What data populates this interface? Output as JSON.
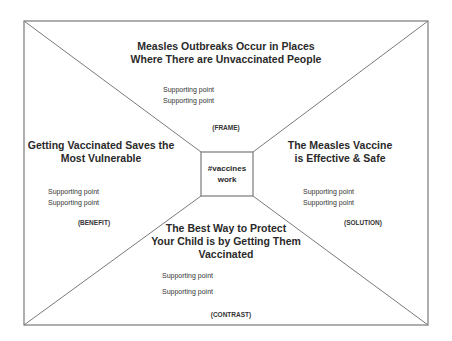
{
  "diagram": {
    "center": "#vaccines work",
    "sections": {
      "top": {
        "title_lines": [
          "Measles Outbreaks Occur in Places",
          "Where There are Unvaccinated People"
        ],
        "points": [
          "Supporting point",
          "Supporting point"
        ],
        "tag": "(FRAME)"
      },
      "left": {
        "title_lines": [
          "Getting Vaccinated Saves the",
          "Most Vulnerable"
        ],
        "points": [
          "Supporting point",
          "Supporting point"
        ],
        "tag": "(BENEFIT)"
      },
      "right": {
        "title_lines": [
          "The Measles Vaccine",
          "is Effective & Safe"
        ],
        "points": [
          "Supporting point",
          "Supporting point"
        ],
        "tag": "(SOLUTION)"
      },
      "bottom": {
        "title_lines": [
          "The Best Way to Protect",
          "Your Child is by Getting Them",
          "Vaccinated"
        ],
        "points": [
          "Supporting point",
          "Supporting point"
        ],
        "tag": "(CONTRAST)"
      }
    },
    "colors": {
      "line": "#7a7a7a",
      "text": "#2a2a2a",
      "background": "#ffffff"
    }
  }
}
